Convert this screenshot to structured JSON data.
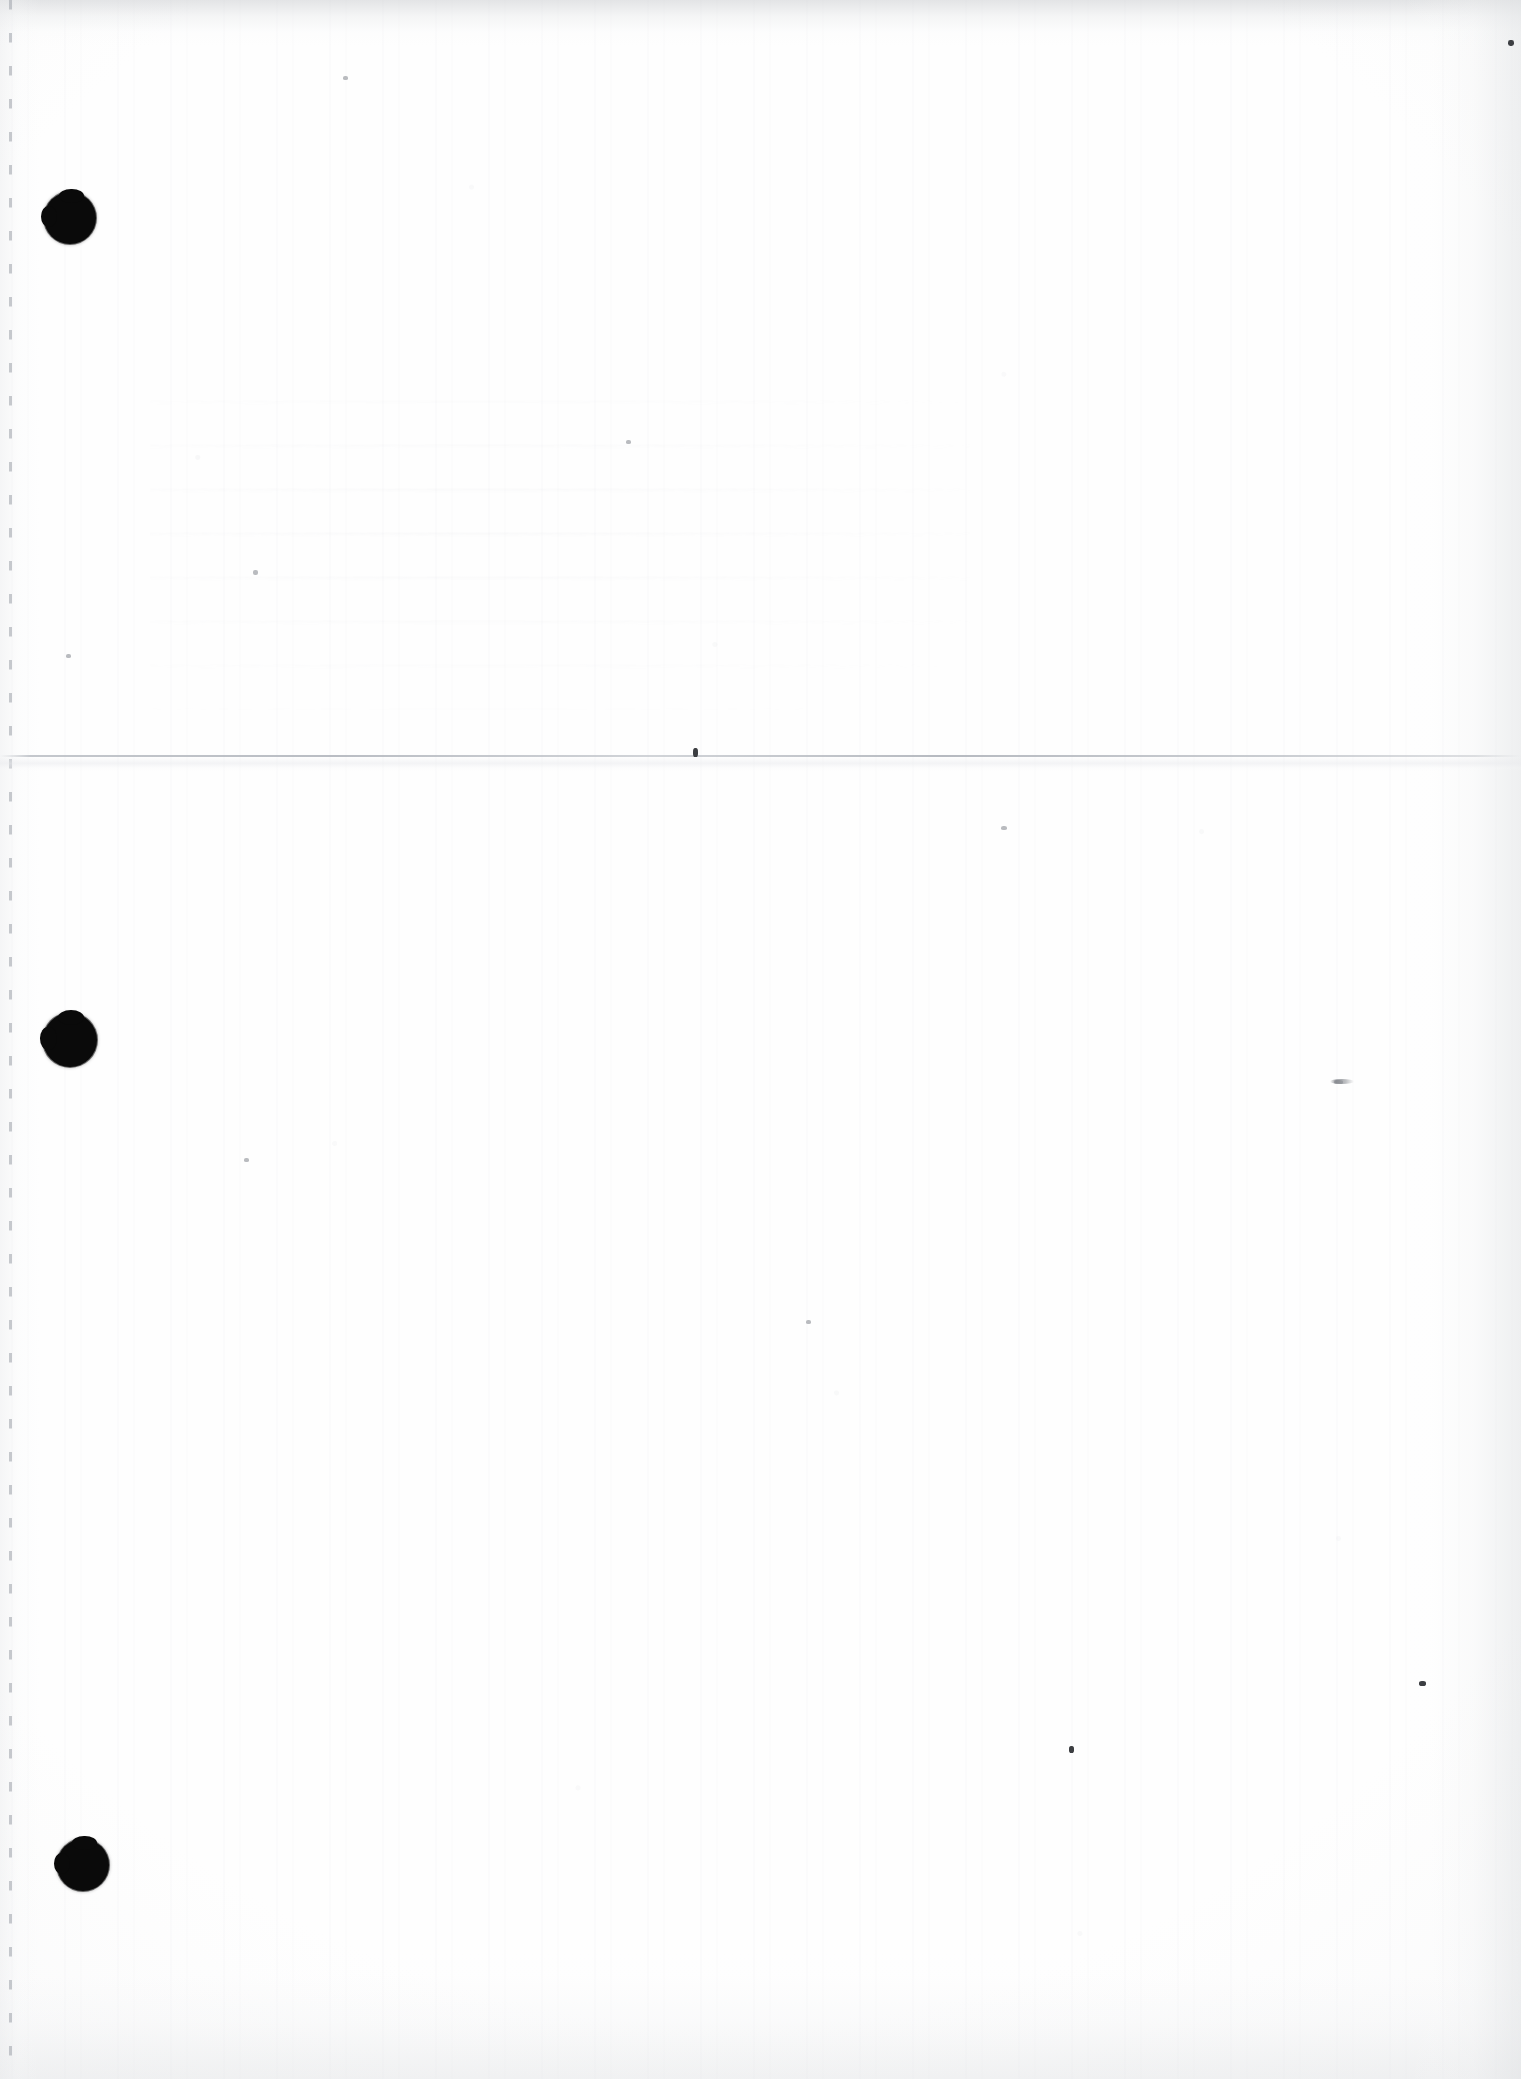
{
  "document": {
    "kind": "scanned-page",
    "page_content_text": "",
    "is_blank": "true",
    "width_px": 1521,
    "height_px": 2079
  },
  "colors": {
    "paper": "#fefefe",
    "ink": "#0a0a0a",
    "fold_line": "#b2b6bd",
    "margin_dash": "#a8acb3",
    "scan_shadow": "#e2e4e6",
    "speck": "#6f7175"
  },
  "artifacts": {
    "punch_holes": [
      {
        "name": "punch-hole-top",
        "cx": 70,
        "cy": 218,
        "r": 26
      },
      {
        "name": "punch-hole-middle",
        "cx": 70,
        "cy": 1040,
        "r": 27
      },
      {
        "name": "punch-hole-bottom",
        "cx": 83,
        "cy": 1865,
        "r": 26
      }
    ],
    "fold_line": {
      "name": "horizontal-fold-crease",
      "y": 755
    },
    "margin_guide": {
      "name": "left-margin-dashed-guide",
      "x": 9
    },
    "specks": [
      {
        "name": "speck-top-right",
        "x": 1508,
        "y": 40,
        "w": 6,
        "h": 6,
        "tone": "dark"
      },
      {
        "name": "speck-mid-right",
        "x": 1334,
        "y": 1080,
        "w": 9,
        "h": 4,
        "tone": "faint"
      },
      {
        "name": "speck-lower-center",
        "x": 1069,
        "y": 1746,
        "w": 5,
        "h": 7,
        "tone": "dark"
      },
      {
        "name": "speck-lower-right",
        "x": 1419,
        "y": 1681,
        "w": 7,
        "h": 5,
        "tone": "dark"
      },
      {
        "name": "speck-upper-left",
        "x": 343,
        "y": 76,
        "w": 5,
        "h": 4,
        "tone": "faint"
      },
      {
        "name": "speck-mid-left",
        "x": 66,
        "y": 654,
        "w": 5,
        "h": 4,
        "tone": "faint"
      },
      {
        "name": "speck-center-upper",
        "x": 626,
        "y": 440,
        "w": 5,
        "h": 4,
        "tone": "faint"
      },
      {
        "name": "speck-fold-center",
        "x": 693,
        "y": 748,
        "w": 5,
        "h": 9,
        "tone": "dark"
      },
      {
        "name": "speck-center-low",
        "x": 806,
        "y": 1320,
        "w": 5,
        "h": 4,
        "tone": "faint"
      },
      {
        "name": "speck-left-low",
        "x": 244,
        "y": 1158,
        "w": 5,
        "h": 4,
        "tone": "faint"
      },
      {
        "name": "speck-right-mid",
        "x": 1001,
        "y": 826,
        "w": 6,
        "h": 4,
        "tone": "faint"
      },
      {
        "name": "speck-left-upper",
        "x": 253,
        "y": 570,
        "w": 5,
        "h": 5,
        "tone": "faint"
      }
    ]
  }
}
